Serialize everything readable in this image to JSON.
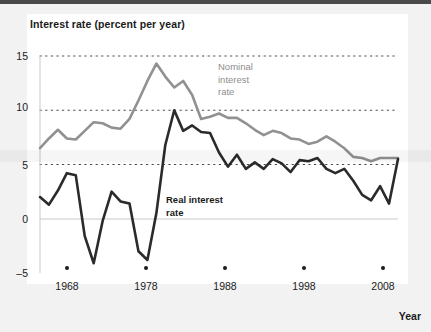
{
  "chart_data": {
    "type": "line",
    "title": "Interest rate (percent per year)",
    "xlabel": "Year",
    "ylabel": "Interest rate (percent per year)",
    "xlim": [
      1968,
      2008
    ],
    "ylim": [
      -5,
      15
    ],
    "yticks": [
      "15",
      "10",
      "5",
      "0",
      "-5"
    ],
    "ytick_values": [
      15,
      10,
      5,
      0,
      -5
    ],
    "xticks": [
      "1968",
      "1978",
      "1988",
      "1998",
      "2008"
    ],
    "xtick_values": [
      1968,
      1978,
      1988,
      1998,
      2008
    ],
    "grid": "horizontal-dotted",
    "legend": "inline-annotations",
    "x": [
      1968,
      1969,
      1970,
      1971,
      1972,
      1973,
      1974,
      1975,
      1976,
      1977,
      1978,
      1979,
      1980,
      1981,
      1982,
      1983,
      1984,
      1985,
      1986,
      1987,
      1988,
      1989,
      1990,
      1991,
      1992,
      1993,
      1994,
      1995,
      1996,
      1997,
      1998,
      1999,
      2000,
      2001,
      2002,
      2003,
      2004,
      2005,
      2006,
      2007,
      2008
    ],
    "series": [
      {
        "name": "Nominal interest rate",
        "color": "#919191",
        "values": [
          6.5,
          7.4,
          8.2,
          7.4,
          7.3,
          8.1,
          8.9,
          8.8,
          8.4,
          8.3,
          9.2,
          10.9,
          12.7,
          14.3,
          13.1,
          12.1,
          12.7,
          11.4,
          9.2,
          9.4,
          9.7,
          9.3,
          9.3,
          8.8,
          8.2,
          7.7,
          8.1,
          7.9,
          7.4,
          7.3,
          6.9,
          7.1,
          7.6,
          7.1,
          6.5,
          5.7,
          5.6,
          5.3,
          5.6,
          5.6,
          5.6
        ]
      },
      {
        "name": "Real interest rate",
        "color": "#2b2b2b",
        "values": [
          2.0,
          1.3,
          2.6,
          4.2,
          4.0,
          -1.6,
          -4.1,
          -0.2,
          2.5,
          1.6,
          1.4,
          -3.0,
          -3.8,
          0.5,
          6.8,
          10.0,
          8.1,
          8.6,
          8.0,
          7.9,
          6.1,
          4.8,
          5.9,
          4.6,
          5.2,
          4.6,
          5.5,
          5.1,
          4.3,
          5.4,
          5.3,
          5.6,
          4.6,
          4.2,
          4.6,
          3.5,
          2.2,
          1.7,
          3.0,
          1.4,
          5.5
        ]
      }
    ],
    "annotations": [
      {
        "id": "nominal",
        "text": "Nominal\ninterest\nrate",
        "color": "#8e8e8e"
      },
      {
        "id": "real",
        "text": "Real interest\nrate",
        "color": "#1b1b1b"
      }
    ]
  },
  "axes": {
    "y_labels": [
      "15",
      "10",
      "5",
      "0",
      "–5"
    ],
    "x_labels": [
      "1968",
      "1978",
      "1988",
      "1998",
      "2008"
    ],
    "x_title": "Year"
  }
}
